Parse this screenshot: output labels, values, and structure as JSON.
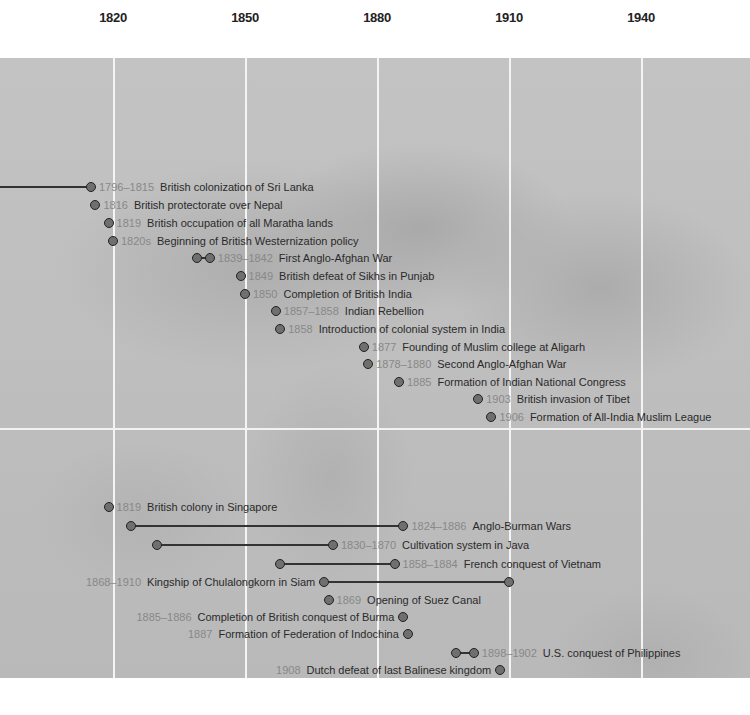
{
  "chart_data": {
    "type": "timeline",
    "title": "",
    "axis": {
      "ticks": [
        1820,
        1850,
        1880,
        1910,
        1940
      ],
      "range": [
        1795,
        1952
      ],
      "grid": true
    },
    "layout": {
      "x0_year": 1820,
      "x0_px": 113,
      "px_per_year": 4.4,
      "bands": [
        "South Asia",
        "Southeast Asia"
      ]
    },
    "events": [
      {
        "band": "South Asia",
        "label_year": "1796–1815",
        "text": "British colonization of Sri Lanka",
        "start": 1796,
        "end": 1815,
        "y": 187,
        "start_dot": false,
        "dot_year": 1815,
        "label_side": "right"
      },
      {
        "band": "South Asia",
        "label_year": "1816",
        "text": "British protectorate over Nepal",
        "start": 1816,
        "end": 1816,
        "y": 205,
        "label_side": "right"
      },
      {
        "band": "South Asia",
        "label_year": "1819",
        "text": "British occupation of all Maratha lands",
        "start": 1819,
        "end": 1819,
        "y": 223,
        "label_side": "right"
      },
      {
        "band": "South Asia",
        "label_year": "1820s",
        "text": "Beginning of British Westernization policy",
        "start": 1820,
        "end": 1820,
        "y": 241,
        "label_side": "right"
      },
      {
        "band": "South Asia",
        "label_year": "1839–1842",
        "text": "First Anglo-Afghan War",
        "start": 1839,
        "end": 1842,
        "y": 258,
        "label_side": "right"
      },
      {
        "band": "South Asia",
        "label_year": "1849",
        "text": "British defeat of Sikhs in Punjab",
        "start": 1849,
        "end": 1849,
        "y": 276,
        "label_side": "right"
      },
      {
        "band": "South Asia",
        "label_year": "1850",
        "text": "Completion of British India",
        "start": 1850,
        "end": 1850,
        "y": 294,
        "label_side": "right"
      },
      {
        "band": "South Asia",
        "label_year": "1857–1858",
        "text": "Indian Rebellion",
        "start": 1857,
        "end": 1857,
        "y": 311,
        "label_side": "right"
      },
      {
        "band": "South Asia",
        "label_year": "1858",
        "text": "Introduction of colonial system in India",
        "start": 1858,
        "end": 1858,
        "y": 329,
        "label_side": "right"
      },
      {
        "band": "South Asia",
        "label_year": "1877",
        "text": "Founding of Muslim college at Aligarh",
        "start": 1877,
        "end": 1877,
        "y": 347,
        "label_side": "right"
      },
      {
        "band": "South Asia",
        "label_year": "1878–1880",
        "text": "Second Anglo-Afghan War",
        "start": 1878,
        "end": 1878,
        "y": 364,
        "label_side": "right"
      },
      {
        "band": "South Asia",
        "label_year": "1885",
        "text": "Formation of Indian National Congress",
        "start": 1885,
        "end": 1885,
        "y": 382,
        "label_side": "right"
      },
      {
        "band": "South Asia",
        "label_year": "1903",
        "text": "British invasion of Tibet",
        "start": 1903,
        "end": 1903,
        "y": 399,
        "label_side": "right"
      },
      {
        "band": "South Asia",
        "label_year": "1906",
        "text": "Formation of All-India Muslim League",
        "start": 1906,
        "end": 1906,
        "y": 417,
        "label_side": "right"
      },
      {
        "band": "Southeast Asia",
        "label_year": "1819",
        "text": "British colony in Singapore",
        "start": 1819,
        "end": 1819,
        "y": 507,
        "label_side": "right"
      },
      {
        "band": "Southeast Asia",
        "label_year": "1824–1886",
        "text": "Anglo-Burman Wars",
        "start": 1824,
        "end": 1886,
        "y": 526,
        "label_side": "right"
      },
      {
        "band": "Southeast Asia",
        "label_year": "1830–1870",
        "text": "Cultivation system in Java",
        "start": 1830,
        "end": 1870,
        "y": 545,
        "label_side": "right"
      },
      {
        "band": "Southeast Asia",
        "label_year": "1858–1884",
        "text": "French conquest of Vietnam",
        "start": 1858,
        "end": 1884,
        "y": 564,
        "label_side": "right"
      },
      {
        "band": "Southeast Asia",
        "label_year": "1868–1910",
        "text": "Kingship of Chulalongkorn in Siam",
        "start": 1868,
        "end": 1910,
        "y": 582,
        "label_side": "left"
      },
      {
        "band": "Southeast Asia",
        "label_year": "1869",
        "text": "Opening of Suez Canal",
        "start": 1869,
        "end": 1869,
        "y": 600,
        "label_side": "right"
      },
      {
        "band": "Southeast Asia",
        "label_year": "1885–1886",
        "text": "Completion of British conquest of Burma",
        "start": 1886,
        "end": 1886,
        "y": 617,
        "label_side": "left"
      },
      {
        "band": "Southeast Asia",
        "label_year": "1887",
        "text": "Formation of Federation of Indochina",
        "start": 1887,
        "end": 1887,
        "y": 634,
        "label_side": "left"
      },
      {
        "band": "Southeast Asia",
        "label_year": "1898–1902",
        "text": "U.S. conquest of Philippines",
        "start": 1898,
        "end": 1902,
        "y": 653,
        "label_side": "right"
      },
      {
        "band": "Southeast Asia",
        "label_year": "1908",
        "text": "Dutch defeat of last Balinese kingdom",
        "start": 1908,
        "end": 1908,
        "y": 670,
        "label_side": "left"
      }
    ]
  },
  "colors": {
    "dot_fill": "#6f6f6f",
    "dot_stroke": "#222222",
    "year_text": "#888888",
    "event_text": "#2a2a2a",
    "gridline": "#f4f4f4",
    "map": "#bdbdbd"
  }
}
